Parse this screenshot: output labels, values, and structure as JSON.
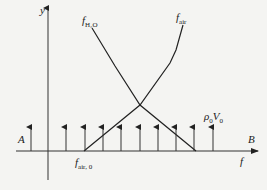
{
  "diagram": {
    "axes": {
      "y_label": "y",
      "x_label": "f"
    },
    "curves": [
      {
        "name": "f_H2O",
        "label_main": "f",
        "label_sub": "H₂O"
      },
      {
        "name": "f_air",
        "label_main": "f",
        "label_sub": "air"
      }
    ],
    "baseline_label": {
      "main": "f",
      "sub": "air, 0"
    },
    "line_labels": {
      "left": "A",
      "right": "B"
    },
    "flow_label": {
      "rho": "ρ",
      "rho_sub": "0",
      "v": "V",
      "v_sub": "0"
    },
    "arrow_x_positions": [
      31,
      66,
      85,
      103,
      121,
      140,
      158,
      176,
      194,
      213
    ],
    "colors": {
      "line": "#222222",
      "background": "#f4f4f2"
    }
  }
}
